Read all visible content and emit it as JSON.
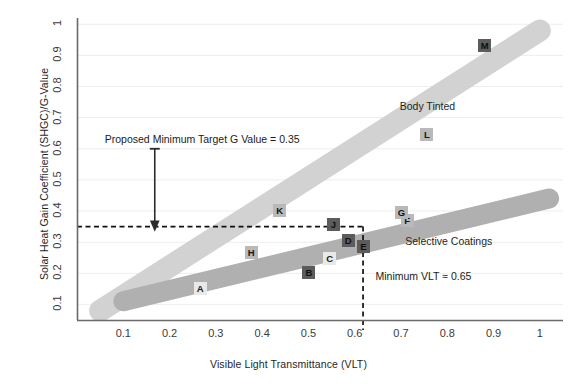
{
  "chart_data": {
    "type": "scatter",
    "title": "",
    "xlabel": "Visible Light Transmittance (VLT)",
    "ylabel": "Solar Heat Gain Coefficient (SHGC)/G-Value",
    "xlim": [
      0.0,
      1.05
    ],
    "ylim": [
      0.05,
      1.02
    ],
    "xticks": [
      "0.1",
      "0.2",
      "0.3",
      "0.4",
      "0.5",
      "0.6",
      "0.7",
      "0.8",
      "0.9",
      "1"
    ],
    "xtick_values": [
      0.1,
      0.2,
      0.3,
      0.4,
      0.5,
      0.6,
      0.7,
      0.8,
      0.9,
      1.0
    ],
    "yticks": [
      "0.1",
      "0.2",
      "0.3",
      "0.4",
      "0.5",
      "0.6",
      "0.7",
      "0.8",
      "0.9",
      "1"
    ],
    "ytick_values": [
      0.1,
      0.2,
      0.3,
      0.4,
      0.5,
      0.6,
      0.7,
      0.8,
      0.9,
      1.0
    ],
    "grid": "horizontal",
    "legend_position": "inline-band-labels",
    "points": [
      {
        "label": "A",
        "x": 0.265,
        "y": 0.15,
        "style": "light"
      },
      {
        "label": "B",
        "x": 0.5,
        "y": 0.2,
        "style": "dark"
      },
      {
        "label": "C",
        "x": 0.545,
        "y": 0.245,
        "style": "light"
      },
      {
        "label": "D",
        "x": 0.585,
        "y": 0.305,
        "style": "dark"
      },
      {
        "label": "E",
        "x": 0.618,
        "y": 0.283,
        "style": "dark"
      },
      {
        "label": "F",
        "x": 0.712,
        "y": 0.368,
        "style": "mid"
      },
      {
        "label": "G",
        "x": 0.7,
        "y": 0.393,
        "style": "mid"
      },
      {
        "label": "H",
        "x": 0.375,
        "y": 0.265,
        "style": "mid"
      },
      {
        "label": "J",
        "x": 0.553,
        "y": 0.355,
        "style": "dark"
      },
      {
        "label": "K",
        "x": 0.437,
        "y": 0.4,
        "style": "mid"
      },
      {
        "label": "L",
        "x": 0.755,
        "y": 0.645,
        "style": "mid"
      },
      {
        "label": "M",
        "x": 0.88,
        "y": 0.93,
        "style": "dark"
      }
    ],
    "bands": [
      {
        "name": "Body Tinted",
        "label": "Body Tinted",
        "color": "#d2d2d2",
        "from": [
          0.05,
          0.08
        ],
        "to": [
          1.0,
          0.98
        ],
        "label_x": 0.775,
        "label_y": 0.735
      },
      {
        "name": "Selective Coatings",
        "label": "Selective Coatings",
        "color": "#b0b0b0",
        "from": [
          0.1,
          0.11
        ],
        "to": [
          1.02,
          0.44
        ],
        "label_x": 0.8,
        "label_y": 0.3
      }
    ],
    "annotations": [
      {
        "name": "target-g-value",
        "text": "Proposed Minimum Target G Value = 0.35",
        "value": 0.35,
        "kind": "horizontal-threshold-with-arrow",
        "arrow_x": 0.168,
        "arrow_top_y": 0.6,
        "arrow_bottom_y": 0.35,
        "text_x": 0.06,
        "text_y": 0.625
      },
      {
        "name": "minimum-vlt",
        "text": "Minimum VLT ≈ 0.65",
        "value": 0.65,
        "kind": "vertical-threshold",
        "line_x": 0.618,
        "text_x": 0.645,
        "text_y": 0.185
      }
    ]
  },
  "axes": {
    "x_title": "Visible Light Transmittance (VLT)",
    "y_title": "Solar Heat Gain Coefficient (SHGC)/G-Value"
  },
  "colors": {
    "band_body_tinted": "#d2d2d2",
    "band_selective": "#b0b0b0",
    "axis": "#6a6a6a",
    "grid": "#ededed",
    "text": "#1d1d1d",
    "marker_dark": "#5c5c5c",
    "marker_light": "#e9e9e9",
    "marker_mid": "#b9b9b9"
  }
}
